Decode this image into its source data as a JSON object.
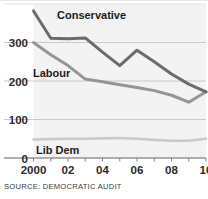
{
  "source": {
    "text": "SOURCE: DEMOCRATIC AUDIT"
  },
  "axis": {
    "y_ticks": [
      "0",
      "100",
      "200",
      "300"
    ],
    "x_ticks": [
      "2000",
      "02",
      "04",
      "06",
      "08",
      "10"
    ]
  },
  "labels": {
    "conservative": "Conservative",
    "labour": "Labour",
    "libdem": "Lib Dem"
  },
  "colors": {
    "conservative": "#6b6b6b",
    "labour": "#959595",
    "libdem": "#c9c9c9",
    "grid": "#c4c4c4",
    "plot_bg": "#f3f3f3",
    "text": "#2b2b2b"
  },
  "chart_data": {
    "type": "line",
    "title": "",
    "xlabel": "",
    "ylabel": "",
    "xlim": [
      2000,
      2010
    ],
    "ylim": [
      0,
      400
    ],
    "yticks": [
      0,
      100,
      200,
      300
    ],
    "xticks": [
      2000,
      2002,
      2004,
      2006,
      2008,
      2010
    ],
    "xticklabels": [
      "2000",
      "02",
      "04",
      "06",
      "08",
      "10"
    ],
    "grid": true,
    "legend": "inline-labels",
    "x": [
      2000,
      2001,
      2002,
      2003,
      2004,
      2005,
      2006,
      2007,
      2008,
      2009,
      2010
    ],
    "series": [
      {
        "name": "Conservative",
        "color": "#6b6b6b",
        "values": [
          382,
          311,
          310,
          312,
          275,
          240,
          280,
          250,
          218,
          192,
          172
        ]
      },
      {
        "name": "Labour",
        "color": "#959595",
        "values": [
          300,
          268,
          240,
          205,
          198,
          190,
          183,
          175,
          163,
          145,
          172
        ]
      },
      {
        "name": "Lib Dem",
        "color": "#c9c9c9",
        "values": [
          48,
          49,
          50,
          50,
          51,
          52,
          50,
          47,
          45,
          45,
          50
        ]
      }
    ]
  }
}
